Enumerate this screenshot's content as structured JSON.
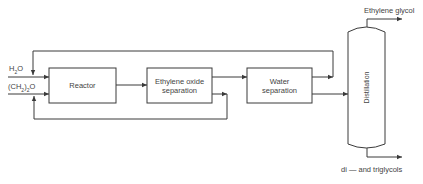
{
  "inputs": {
    "water": {
      "base": "H",
      "sub": "2",
      "tail": "O"
    },
    "ethylene_oxide": {
      "pre": "(CH",
      "sub1": "2",
      "mid": ")",
      "sub2": "2",
      "tail": "O"
    }
  },
  "units": {
    "reactor": "Reactor",
    "eo_separation_line1": "Ethylene oxide",
    "eo_separation_line2": "separation",
    "water_separation_line1": "Water",
    "water_separation_line2": "separation",
    "distillation": "Distillation"
  },
  "outputs": {
    "top": "Ethylene glycol",
    "bottom": "di — and triglycols"
  },
  "colors": {
    "line": "#3a3a3a",
    "background": "#ffffff"
  }
}
